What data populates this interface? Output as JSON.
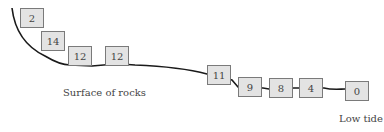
{
  "diagram": {
    "boxes": [
      {
        "value": "2",
        "x": 20,
        "y": 8
      },
      {
        "value": "14",
        "x": 41,
        "y": 31
      },
      {
        "value": "12",
        "x": 68,
        "y": 46
      },
      {
        "value": "12",
        "x": 105,
        "y": 46
      },
      {
        "value": "11",
        "x": 207,
        "y": 65
      },
      {
        "value": "9",
        "x": 238,
        "y": 77
      },
      {
        "value": "8",
        "x": 269,
        "y": 78
      },
      {
        "value": "4",
        "x": 299,
        "y": 78
      },
      {
        "value": "0",
        "x": 345,
        "y": 81
      }
    ],
    "labels": {
      "surface": "Surface of rocks",
      "low_tide": "Low tide"
    },
    "line_color": "#1a1a1a",
    "box_fill": "#e3e3e3"
  }
}
